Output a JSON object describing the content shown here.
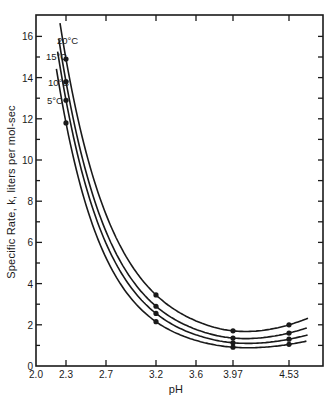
{
  "chart_data": {
    "type": "line",
    "title": "",
    "xlabel": "pH",
    "ylabel": "Specific Rate, k, liters per mol-sec",
    "xlim": [
      2.0,
      4.8
    ],
    "ylim": [
      0,
      17
    ],
    "x_ticks": [
      2.0,
      2.3,
      2.7,
      3.2,
      3.6,
      3.97,
      4.53
    ],
    "x_tick_labels": [
      "2.0",
      "2.3",
      "2.7",
      "3.2",
      "3.6",
      "3.97",
      "4.53"
    ],
    "y_ticks": [
      0,
      2,
      4,
      6,
      8,
      10,
      12,
      14,
      16
    ],
    "y_tick_labels": [
      "0",
      "2",
      "4",
      "6",
      "8",
      "10",
      "12",
      "14",
      "16"
    ],
    "grid": false,
    "legend": "inline labels at top-left of curves",
    "x": [
      2.3,
      3.2,
      3.97,
      4.53
    ],
    "series": [
      {
        "name": "20°C",
        "values": [
          14.9,
          3.45,
          1.65,
          2.0
        ]
      },
      {
        "name": "15°C",
        "values": [
          13.8,
          2.9,
          1.3,
          1.6
        ]
      },
      {
        "name": "10°C",
        "values": [
          12.9,
          2.55,
          1.05,
          1.3
        ]
      },
      {
        "name": "5°C",
        "values": [
          11.8,
          2.15,
          0.85,
          1.05
        ]
      }
    ]
  },
  "layout": {
    "plot": {
      "left": 36,
      "right": 323,
      "top": 15,
      "bottom": 366
    },
    "line_color": "#1a1a1a"
  }
}
